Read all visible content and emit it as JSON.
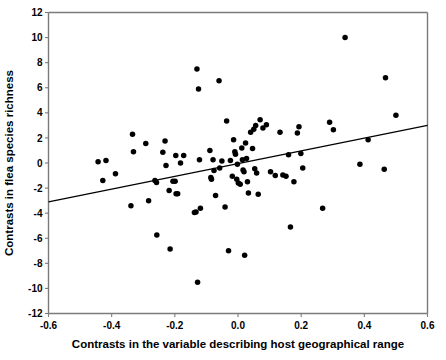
{
  "chart_data": {
    "type": "scatter",
    "title": "",
    "xlabel": "Contrasts in the variable describing host geographical range",
    "ylabel": "Contrasts in flea species richness",
    "xlim": [
      -0.6,
      0.6
    ],
    "ylim": [
      -12,
      12
    ],
    "xticks": [
      -0.6,
      -0.4,
      -0.2,
      0.0,
      0.2,
      0.4,
      0.6
    ],
    "xticklabels": [
      "-0.6",
      "-0.4",
      "-0.2",
      "0.0",
      "0.2",
      "0.4",
      "0.6"
    ],
    "yticks": [
      -12,
      -10,
      -8,
      -6,
      -4,
      -2,
      0,
      2,
      4,
      6,
      8,
      10,
      12
    ],
    "yticklabels": [
      "-12",
      "-10",
      "-8",
      "-6",
      "-4",
      "-2",
      "0",
      "2",
      "4",
      "6",
      "8",
      "10",
      "12"
    ],
    "grid": false,
    "legend": null,
    "marker": "filled-circle",
    "marker_color": "#000000",
    "trendline": {
      "type": "linear-regression",
      "color": "#000000",
      "x_start": -0.6,
      "y_start": -3.1,
      "x_end": 0.6,
      "y_end": 3.0,
      "slope": 5.083,
      "intercept": -0.05
    },
    "points": [
      [
        -0.443,
        0.1
      ],
      [
        -0.428,
        -1.4
      ],
      [
        -0.418,
        0.2
      ],
      [
        -0.388,
        -0.85
      ],
      [
        -0.339,
        -3.4
      ],
      [
        -0.334,
        2.3
      ],
      [
        -0.331,
        0.9
      ],
      [
        -0.292,
        1.55
      ],
      [
        -0.283,
        -3.0
      ],
      [
        -0.263,
        -1.4
      ],
      [
        -0.258,
        -1.55
      ],
      [
        -0.257,
        -5.75
      ],
      [
        -0.238,
        0.85
      ],
      [
        -0.231,
        1.75
      ],
      [
        -0.228,
        -0.2
      ],
      [
        -0.218,
        -2.2
      ],
      [
        -0.215,
        -6.85
      ],
      [
        -0.206,
        -1.45
      ],
      [
        -0.199,
        -1.45
      ],
      [
        -0.197,
        0.6
      ],
      [
        -0.196,
        -2.45
      ],
      [
        -0.191,
        -2.45
      ],
      [
        -0.182,
        0.0
      ],
      [
        -0.172,
        0.6
      ],
      [
        -0.138,
        -3.95
      ],
      [
        -0.133,
        -3.9
      ],
      [
        -0.13,
        7.5
      ],
      [
        -0.128,
        -9.5
      ],
      [
        -0.125,
        5.9
      ],
      [
        -0.122,
        0.25
      ],
      [
        -0.119,
        -3.6
      ],
      [
        -0.089,
        1.0
      ],
      [
        -0.086,
        -1.15
      ],
      [
        -0.084,
        -1.3
      ],
      [
        -0.079,
        0.25
      ],
      [
        -0.076,
        -0.6
      ],
      [
        -0.071,
        -2.6
      ],
      [
        -0.06,
        6.55
      ],
      [
        -0.058,
        -0.4
      ],
      [
        -0.051,
        0.15
      ],
      [
        -0.041,
        -3.5
      ],
      [
        -0.036,
        3.35
      ],
      [
        -0.03,
        -7.0
      ],
      [
        -0.024,
        0.2
      ],
      [
        -0.018,
        -1.05
      ],
      [
        -0.014,
        1.85
      ],
      [
        -0.01,
        0.9
      ],
      [
        -0.008,
        0.7
      ],
      [
        -0.004,
        -1.3
      ],
      [
        -0.002,
        -0.1
      ],
      [
        0.001,
        -1.6
      ],
      [
        0.007,
        -1.7
      ],
      [
        0.012,
        1.2
      ],
      [
        0.014,
        0.25
      ],
      [
        0.016,
        -0.55
      ],
      [
        0.019,
        -0.7
      ],
      [
        0.021,
        -7.35
      ],
      [
        0.024,
        1.6
      ],
      [
        0.027,
        0.35
      ],
      [
        0.03,
        -1.5
      ],
      [
        0.033,
        -2.4
      ],
      [
        0.04,
        2.45
      ],
      [
        0.046,
        1.15
      ],
      [
        0.05,
        2.7
      ],
      [
        0.053,
        -0.45
      ],
      [
        0.056,
        3.0
      ],
      [
        0.059,
        -0.8
      ],
      [
        0.064,
        -2.5
      ],
      [
        0.07,
        3.45
      ],
      [
        0.079,
        2.8
      ],
      [
        0.09,
        3.05
      ],
      [
        0.103,
        -0.7
      ],
      [
        0.118,
        -1.0
      ],
      [
        0.133,
        2.45
      ],
      [
        0.142,
        -0.95
      ],
      [
        0.152,
        -1.05
      ],
      [
        0.16,
        0.65
      ],
      [
        0.166,
        -5.1
      ],
      [
        0.177,
        -1.5
      ],
      [
        0.188,
        2.4
      ],
      [
        0.193,
        2.9
      ],
      [
        0.199,
        0.75
      ],
      [
        0.205,
        -0.4
      ],
      [
        0.268,
        -3.6
      ],
      [
        0.29,
        3.25
      ],
      [
        0.302,
        2.65
      ],
      [
        0.339,
        10.0
      ],
      [
        0.386,
        -0.1
      ],
      [
        0.412,
        1.85
      ],
      [
        0.463,
        -0.5
      ],
      [
        0.467,
        6.8
      ],
      [
        0.5,
        3.8
      ]
    ]
  }
}
